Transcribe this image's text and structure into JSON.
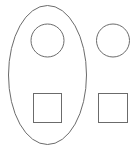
{
  "diagram": {
    "stroke_color": "#6b6b6b",
    "background_color": "#ffffff",
    "groups": [
      {
        "name": "enclosed-group",
        "container": "ellipse",
        "members": [
          "circle",
          "square"
        ]
      }
    ],
    "shapes": [
      {
        "id": "inner-circle",
        "type": "circle",
        "inside_ellipse": true
      },
      {
        "id": "inner-square",
        "type": "square",
        "inside_ellipse": true
      },
      {
        "id": "outer-circle",
        "type": "circle",
        "inside_ellipse": false
      },
      {
        "id": "outer-square",
        "type": "square",
        "inside_ellipse": false
      }
    ]
  }
}
